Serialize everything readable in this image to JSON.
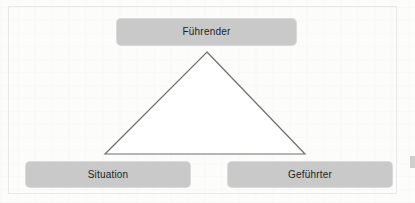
{
  "diagram": {
    "background_color": "#fbfbfa",
    "box_fill_color": "#c9c9c9",
    "box_text_color": "#1d1d1d",
    "triangle_stroke_color": "#6e6e6e",
    "triangle_fill_color": "#ffffff",
    "nodes": [
      {
        "id": "leader",
        "label": "Führender",
        "position": "top-center"
      },
      {
        "id": "situation",
        "label": "Situation",
        "position": "bottom-left"
      },
      {
        "id": "follower",
        "label": "Geführter",
        "position": "bottom-right"
      }
    ],
    "triangle": {
      "apex": {
        "x": 207,
        "y": 52
      },
      "bottom_left": {
        "x": 105,
        "y": 154
      },
      "bottom_right": {
        "x": 305,
        "y": 154
      }
    }
  }
}
